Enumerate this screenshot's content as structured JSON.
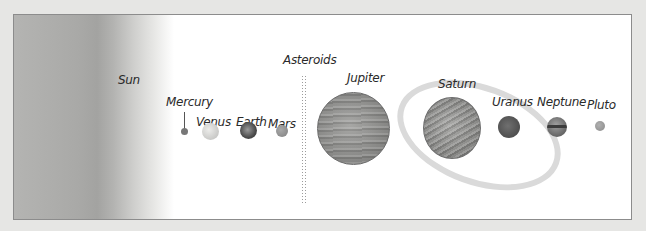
{
  "diagram": {
    "bodies": [
      {
        "name": "Sun",
        "label": "Sun",
        "color": "#a9a9a7"
      },
      {
        "name": "Mercury",
        "label": "Mercury",
        "color": "#777777"
      },
      {
        "name": "Venus",
        "label": "Venus",
        "color": "#d4d4d2"
      },
      {
        "name": "Earth",
        "label": "Earth",
        "color": "#505050"
      },
      {
        "name": "Mars",
        "label": "Mars",
        "color": "#8f8f8f"
      },
      {
        "name": "Asteroids",
        "label": "Asteroids",
        "color": "#8a8a8a"
      },
      {
        "name": "Jupiter",
        "label": "Jupiter",
        "color": "#8c8c8a"
      },
      {
        "name": "Saturn",
        "label": "Saturn",
        "color": "#8e8e8c"
      },
      {
        "name": "Uranus",
        "label": "Uranus",
        "color": "#5a5a5a"
      },
      {
        "name": "Neptune",
        "label": "Neptune",
        "color": "#6f6f6f"
      },
      {
        "name": "Pluto",
        "label": "Pluto",
        "color": "#9a9a9a"
      }
    ]
  }
}
